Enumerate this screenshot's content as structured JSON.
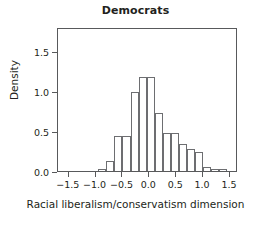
{
  "chart_data": {
    "type": "bar",
    "title": "Democrats",
    "xlabel": "Racial liberalism/conservatism dimension",
    "ylabel": "Density",
    "xlim": [
      -1.7,
      1.65
    ],
    "ylim": [
      0.0,
      1.8
    ],
    "xticks": [
      -1.5,
      -1.0,
      -0.5,
      0.0,
      0.5,
      1.0,
      1.5
    ],
    "xtick_labels": [
      "−1.5",
      "−1.0",
      "−0.5",
      "0.0",
      "0.5",
      "1.0",
      "1.5"
    ],
    "yticks": [
      0.0,
      0.5,
      1.0,
      1.5
    ],
    "ytick_labels": [
      "0.0",
      "0.5",
      "1.0",
      "1.5"
    ],
    "grid": false,
    "legend": "none",
    "bin_width": 0.15,
    "bin_edges": [
      -0.95,
      -0.8,
      -0.65,
      -0.5,
      -0.35,
      -0.2,
      -0.05,
      0.1,
      0.25,
      0.4,
      0.55,
      0.7,
      0.85,
      1.0,
      1.15,
      1.3,
      1.45
    ],
    "categories": [
      "-0.95 to -0.80",
      "-0.80 to -0.65",
      "-0.65 to -0.50",
      "-0.50 to -0.35",
      "-0.35 to -0.20",
      "-0.20 to -0.05",
      "-0.05 to 0.10",
      "0.10 to 0.25",
      "0.25 to 0.40",
      "0.40 to 0.55",
      "0.55 to 0.70",
      "0.70 to 0.85",
      "0.85 to 1.00",
      "1.00 to 1.15",
      "1.15 to 1.30",
      "1.30 to 1.45"
    ],
    "values": [
      0.02,
      0.12,
      0.44,
      0.44,
      0.99,
      1.18,
      1.18,
      0.73,
      0.48,
      0.48,
      0.34,
      0.27,
      0.24,
      0.05,
      0.02,
      0.02
    ],
    "bars": [
      {
        "x0": -0.95,
        "x1": -0.8,
        "height": 0.02
      },
      {
        "x0": -0.8,
        "x1": -0.65,
        "height": 0.12
      },
      {
        "x0": -0.65,
        "x1": -0.5,
        "height": 0.44
      },
      {
        "x0": -0.5,
        "x1": -0.35,
        "height": 0.44
      },
      {
        "x0": -0.35,
        "x1": -0.2,
        "height": 0.99
      },
      {
        "x0": -0.2,
        "x1": -0.05,
        "height": 1.18
      },
      {
        "x0": -0.05,
        "x1": 0.1,
        "height": 1.18
      },
      {
        "x0": 0.1,
        "x1": 0.25,
        "height": 0.73
      },
      {
        "x0": 0.25,
        "x1": 0.4,
        "height": 0.48
      },
      {
        "x0": 0.4,
        "x1": 0.55,
        "height": 0.48
      },
      {
        "x0": 0.55,
        "x1": 0.7,
        "height": 0.34
      },
      {
        "x0": 0.7,
        "x1": 0.85,
        "height": 0.27
      },
      {
        "x0": 0.85,
        "x1": 1.0,
        "height": 0.24
      },
      {
        "x0": 1.0,
        "x1": 1.15,
        "height": 0.05
      },
      {
        "x0": 1.15,
        "x1": 1.3,
        "height": 0.02
      },
      {
        "x0": 1.3,
        "x1": 1.45,
        "height": 0.02
      }
    ],
    "colors": {
      "bar_fill": "#ffffff",
      "bar_stroke": "#6d6e71",
      "axis": "#58595b",
      "text": "#231f20",
      "background": "#ffffff"
    }
  }
}
